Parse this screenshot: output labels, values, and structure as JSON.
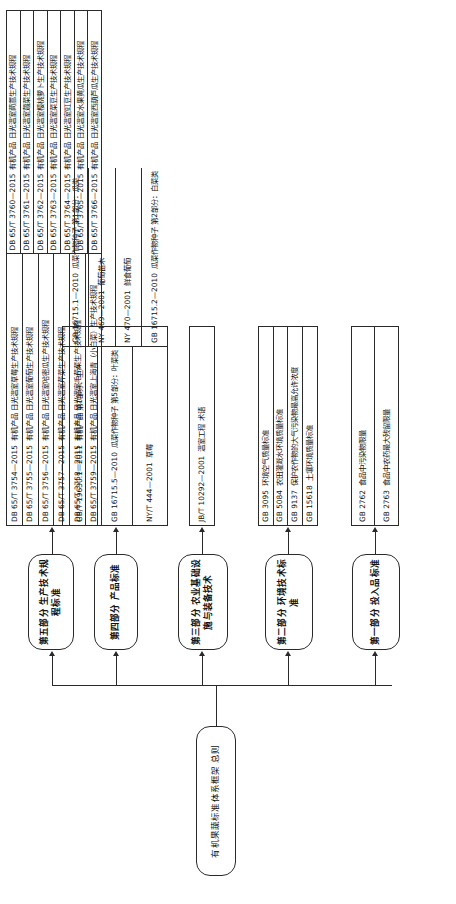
{
  "diagram": {
    "title": "有机果蔬标准体系框架 总则",
    "orientation": "rotated-90"
  },
  "root": {
    "label": "有机果蔬标准体系框架  总则"
  },
  "parts": [
    {
      "id": "part1",
      "label": "第一部分  投入品标准",
      "items": [
        {
          "code": "GB 2762",
          "name": "食品中污染物限量"
        },
        {
          "code": "GB 2763",
          "name": "食品中农药最大残留限量"
        }
      ]
    },
    {
      "id": "part2",
      "label": "第二部分  环境技术标准",
      "items": [
        {
          "code": "GB 3095",
          "name": "环境空气质量标准"
        },
        {
          "code": "GB 5084",
          "name": "农田灌溉水环境质量标准"
        },
        {
          "code": "GB 9137",
          "name": "保护农作物的大气污染物最高允许浓度"
        },
        {
          "code": "GB 15618",
          "name": "土壤环境质量标准"
        }
      ]
    },
    {
      "id": "part3",
      "label": "第三部分  农业基础设施与装备技术",
      "items": [
        {
          "code": "JB/T 10292—2001",
          "name": "温室工程  术语"
        }
      ]
    },
    {
      "id": "part4",
      "label": "第四部分  产品标准",
      "items": [
        {
          "code": "GB/T 19630.1—2011",
          "name": "有机产品  第1部分：生产"
        },
        {
          "code": "GB 16715.5—2010",
          "name": "瓜菜作物种子  第5部分：叶菜类"
        },
        {
          "code": "NY/T 444—2001",
          "name": "草莓"
        },
        {
          "code": "GB 16715.1—2010",
          "name": "瓜菜作物种子  第1部分：瓜类"
        },
        {
          "code": "NY 469—2001",
          "name": "葡萄苗木"
        },
        {
          "code": "NY 470—2001",
          "name": "鲜食葡萄"
        },
        {
          "code": "GB 16715.2—2010",
          "name": "瓜菜作物种子  第2部分：白菜类"
        }
      ]
    },
    {
      "id": "part5",
      "label": "第五部分  生产技术规程标准",
      "items_left": [
        {
          "code": "DB 65/T 3754—2015",
          "name": "有机产品  日光温室草莓生产技术规程"
        },
        {
          "code": "DB 65/T 3755—2015",
          "name": "有机产品  日光温室葡萄生产技术规程"
        },
        {
          "code": "DB 65/T 3756—2015",
          "name": "有机产品  日光温室哈密瓜生产技术规程"
        },
        {
          "code": "DB 65/T 3757—2015",
          "name": "有机产品  日光温室芹菜生产技术规程"
        },
        {
          "code": "DB 65/T 3758—2015",
          "name": "有机产品  日光温室毛芹菜生产技术规程"
        },
        {
          "code": "DB 65/T 3759—2015",
          "name": "有机产品  日光温室上海青（小白菜）生产技术规程"
        }
      ],
      "items_right": [
        {
          "code": "DB 65/T 3760—2015",
          "name": "有机产品  日光温室茼蒿生产技术规程"
        },
        {
          "code": "DB 65/T 3761—2015",
          "name": "有机产品  日光温室蕸菜生产技术规程"
        },
        {
          "code": "DB 65/T 3762—2015",
          "name": "有机产品  日光温室樱桃萝卜生产技术规程"
        },
        {
          "code": "DB 65/T 3763—2015",
          "name": "有机产品  日光温室菜豆生产技术规程"
        },
        {
          "code": "DB 65/T 3764—2015",
          "name": "有机产品  日光温室豇豆生产技术规程"
        },
        {
          "code": "DB 65/T 3765—2015",
          "name": "有机产品  日光温室水果黄瓜生产技术规程"
        },
        {
          "code": "DB 65/T 3766—2015",
          "name": "有机产品  日光温室西葫芦瓜生产技术规程"
        }
      ]
    }
  ]
}
